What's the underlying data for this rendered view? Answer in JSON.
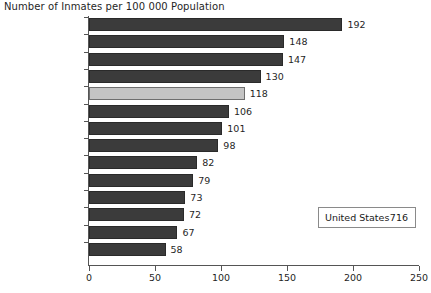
{
  "chart_data": {
    "type": "bar",
    "orientation": "horizontal",
    "title": "Number of Inmates per 100 000 Population",
    "xlabel": "",
    "ylabel": "",
    "xlim": [
      0,
      250
    ],
    "xticks": [
      0,
      50,
      100,
      150,
      200,
      250
    ],
    "grid": false,
    "legend": "none",
    "categories": [
      "New Zealand",
      "England & Wales",
      "Scotland",
      "Australia",
      "Canada",
      "Italy",
      "France",
      "Austria",
      "Switzerland",
      "Germany",
      "Denmark",
      "Norway",
      "Sweden",
      "Finland"
    ],
    "values": [
      192,
      148,
      147,
      130,
      118,
      106,
      101,
      98,
      82,
      79,
      73,
      72,
      67,
      58
    ],
    "highlight_category": "Canada",
    "bar_color": "#3b3b3b",
    "highlight_color": "#c4c4c4",
    "annotation": {
      "label": "United States",
      "value": "716"
    }
  }
}
